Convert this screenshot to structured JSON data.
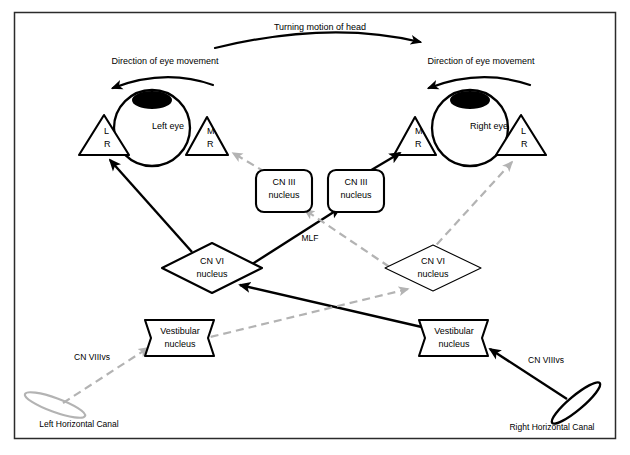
{
  "figure": {
    "type": "diagram",
    "frame_color": "#2b2b2b",
    "active_color": "#000000",
    "inhibited_color": "#b3b3b3"
  },
  "captions": {
    "head_turn": "Turning motion of head",
    "left_eye_movement": "Direction of eye movement",
    "right_eye_movement": "Direction of eye movement"
  },
  "eyes": {
    "left": {
      "label": "Left eye",
      "lateral_rectus": "L\nR",
      "lateral_rectus_line1": "L",
      "lateral_rectus_line2": "R",
      "medial_rectus_line1": "M",
      "medial_rectus_line2": "R"
    },
    "right": {
      "label": "Right eye",
      "lateral_rectus_line1": "L",
      "lateral_rectus_line2": "R",
      "medial_rectus_line1": "M",
      "medial_rectus_line2": "R"
    }
  },
  "nuclei": {
    "cn3_left_line1": "CN III",
    "cn3_left_line2": "nucleus",
    "cn3_right_line1": "CN III",
    "cn3_right_line2": "nucleus",
    "cn6_left_line1": "CN VI",
    "cn6_left_line2": "nucleus",
    "cn6_right_line1": "CN VI",
    "cn6_right_line2": "nucleus",
    "vestibular_left_line1": "Vestibular",
    "vestibular_left_line2": "nucleus",
    "vestibular_right_line1": "Vestibular",
    "vestibular_right_line2": "nucleus"
  },
  "tracts": {
    "mlf": "MLF",
    "cn8_left": "CN VIIIvs",
    "cn8_right": "CN VIIIvs"
  },
  "canals": {
    "left_label": "Left Horizontal Canal",
    "right_label": "Right Horizontal Canal"
  }
}
